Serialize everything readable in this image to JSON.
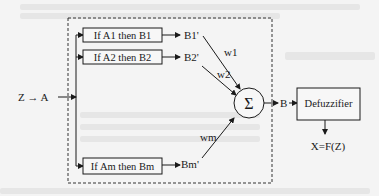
{
  "diagram": {
    "input_label": "Z → A",
    "rules": [
      {
        "label": "If A1 then B1",
        "output": "B1'",
        "weight": "w1"
      },
      {
        "label": "If A2 then B2",
        "output": "B2'",
        "weight": "w2"
      },
      {
        "label": "If Am then Bm",
        "output": "Bm'",
        "weight": "wm"
      }
    ],
    "sum_symbol": "Σ",
    "sum_output": "B",
    "defuzzifier_label": "Defuzzifier",
    "final_output": "X=F(Z)"
  },
  "colors": {
    "stroke": "#1a1a1a",
    "background": "#f4f4f4",
    "box_fill": "#f7f7f7",
    "dashed_border": "#333333"
  }
}
